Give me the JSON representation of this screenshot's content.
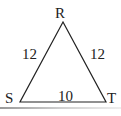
{
  "diagram": {
    "type": "triangle",
    "vertices": [
      {
        "id": "R",
        "label": "R"
      },
      {
        "id": "S",
        "label": "S"
      },
      {
        "id": "T",
        "label": "T"
      }
    ],
    "sides": [
      {
        "between": "R-S",
        "label": "12"
      },
      {
        "between": "R-T",
        "label": "12"
      },
      {
        "between": "S-T",
        "label": "10"
      }
    ],
    "colors": {
      "stroke": "#222222",
      "text": "#222222",
      "rule": "#bbbbbb"
    }
  }
}
